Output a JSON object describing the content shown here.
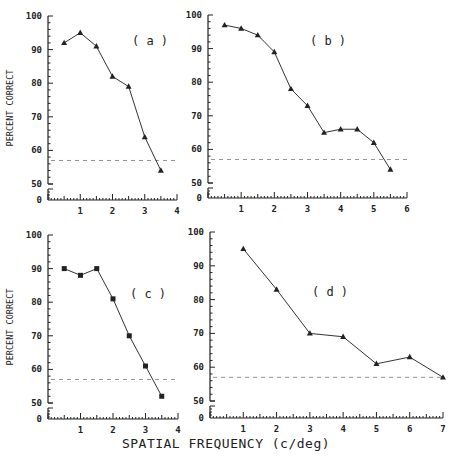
{
  "chart_data": [
    {
      "type": "line",
      "panel_label": "(a)",
      "ylabel": "PERCENT CORRECT",
      "xlabel": "SPATIAL FREQUENCY (c/deg)",
      "marker": "triangle",
      "x": [
        0.5,
        1,
        1.5,
        2,
        2.5,
        3,
        3.5
      ],
      "values": [
        92,
        95,
        91,
        82,
        79,
        64,
        54
      ],
      "chance_level": 57,
      "xlim": [
        0,
        4
      ],
      "xticks": [
        1,
        2,
        3,
        4
      ],
      "ylim": [
        50,
        100
      ],
      "yticks": [
        0,
        50,
        60,
        70,
        80,
        90,
        100
      ],
      "axis_break": true,
      "frame": {
        "x0": 48,
        "xmax_px": 177,
        "y100": 16,
        "y50": 184,
        "ybase": 200,
        "label_x": 150,
        "label_y": 45
      }
    },
    {
      "type": "line",
      "panel_label": "(b)",
      "ylabel": "",
      "xlabel": "SPATIAL FREQUENCY (c/deg)",
      "marker": "triangle",
      "x": [
        0.5,
        1,
        1.5,
        2,
        2.5,
        3,
        3.5,
        4,
        4.5,
        5,
        5.5
      ],
      "values": [
        97,
        96,
        94,
        89,
        78,
        73,
        65,
        66,
        66,
        62,
        54
      ],
      "chance_level": 57,
      "xlim": [
        0,
        6
      ],
      "xticks": [
        1,
        2,
        3,
        4,
        5,
        6
      ],
      "ylim": [
        50,
        100
      ],
      "yticks": [
        0,
        50,
        60,
        70,
        80,
        90,
        100
      ],
      "axis_break": true,
      "frame": {
        "x0": 208,
        "xmax_px": 407,
        "y100": 15,
        "y50": 183,
        "ybase": 198,
        "label_x": 328,
        "label_y": 45
      }
    },
    {
      "type": "line",
      "panel_label": "(c)",
      "ylabel": "PERCENT CORRECT",
      "xlabel": "SPATIAL FREQUENCY (c/deg)",
      "marker": "square",
      "x": [
        0.5,
        1,
        1.5,
        2,
        2.5,
        3,
        3.5
      ],
      "values": [
        90,
        88,
        90,
        81,
        70,
        61,
        52
      ],
      "chance_level": 57,
      "xlim": [
        0,
        4
      ],
      "xticks": [
        1,
        2,
        3,
        4
      ],
      "ylim": [
        50,
        100
      ],
      "yticks": [
        0,
        50,
        60,
        70,
        80,
        90,
        100
      ],
      "axis_break": true,
      "frame": {
        "x0": 48,
        "xmax_px": 178,
        "y100": 235,
        "y50": 403,
        "ybase": 419,
        "label_x": 148,
        "label_y": 298
      }
    },
    {
      "type": "line",
      "panel_label": "(d)",
      "ylabel": "",
      "xlabel": "SPATIAL FREQUENCY (c/deg)",
      "marker": "triangle",
      "x": [
        1,
        2,
        3,
        4,
        5,
        6,
        7
      ],
      "values": [
        95,
        83,
        70,
        69,
        61,
        63,
        57
      ],
      "chance_level": 57,
      "xlim": [
        0,
        7
      ],
      "xticks": [
        1,
        2,
        3,
        4,
        5,
        6,
        7
      ],
      "ylim": [
        50,
        100
      ],
      "yticks": [
        0,
        50,
        60,
        70,
        80,
        90,
        100
      ],
      "axis_break": true,
      "frame": {
        "x0": 210,
        "xmax_px": 443,
        "y100": 232,
        "y50": 401,
        "ybase": 418,
        "label_x": 330,
        "label_y": 296
      }
    }
  ],
  "figure": {
    "xlabel": "SPATIAL FREQUENCY  (c/deg)",
    "ylabel": "PERCENT CORRECT"
  }
}
